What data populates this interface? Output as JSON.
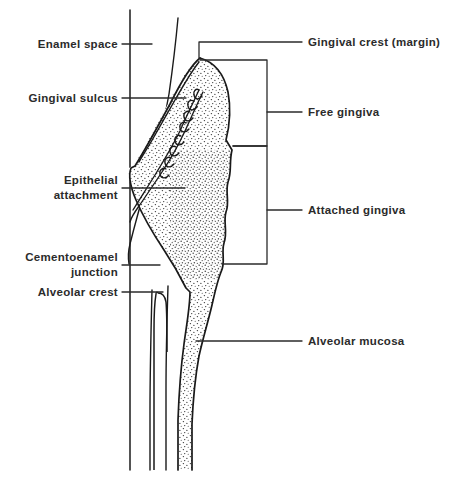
{
  "figure": {
    "background_color": "#ffffff",
    "ink_color": "#1a1a1a",
    "text_color": "#2b2b2b",
    "stipple_color": "#3a3a3a",
    "width": 454,
    "height": 488
  },
  "labels": {
    "left": [
      {
        "id": "enamel-space",
        "text": "Enamel space",
        "x": 118,
        "y": 44,
        "leader_to_x": 152
      },
      {
        "id": "gingival-sulcus",
        "text": "Gingival sulcus",
        "x": 118,
        "y": 98,
        "leader_to_x": 186
      },
      {
        "id": "epithelial-attachment",
        "text": "Epithelial\nattachment",
        "x": 118,
        "y": 180,
        "leader_to_x": 185
      },
      {
        "id": "cementoenamel-junction",
        "text": "Cementoenamel\njunction",
        "x": 118,
        "y": 256,
        "leader_to_x": 160
      },
      {
        "id": "alveolar-crest",
        "text": "Alveolar crest",
        "x": 118,
        "y": 292,
        "leader_to_x": 163
      }
    ],
    "right": [
      {
        "id": "gingival-crest-margin",
        "text": "Gingival crest (margin)",
        "x": 308,
        "y": 42
      },
      {
        "id": "free-gingiva",
        "text": "Free gingiva",
        "x": 308,
        "y": 112
      },
      {
        "id": "attached-gingiva",
        "text": "Attached gingiva",
        "x": 308,
        "y": 210
      },
      {
        "id": "alveolar-mucosa",
        "text": "Alveolar mucosa",
        "x": 308,
        "y": 341
      }
    ]
  },
  "brackets": {
    "free_gingiva": {
      "top": 60,
      "bottom": 146,
      "right_x": 267,
      "tick_y": 112
    },
    "attached_gingiva": {
      "top": 146,
      "bottom": 264,
      "right_x": 267,
      "tick_y": 210
    }
  },
  "structures": {
    "tooth_axis_line_x": 130,
    "enamel_outline_x": 178,
    "root_lines_x": [
      130,
      152,
      168,
      190
    ],
    "drawing_bottom_y": 470
  }
}
